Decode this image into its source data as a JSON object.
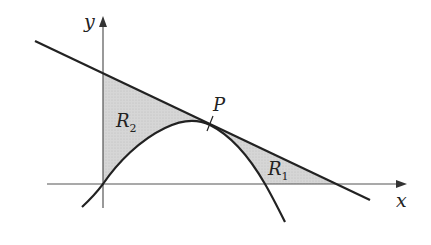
{
  "diagram": {
    "colors": {
      "stroke": "#222222",
      "axis": "#555555",
      "fill": "#d3d3d3",
      "background": "#ffffff"
    },
    "axes": {
      "x_label": "x",
      "y_label": "y"
    },
    "labels": {
      "point": "P",
      "region1": {
        "main": "R",
        "sub": "1"
      },
      "region2": {
        "main": "R",
        "sub": "2"
      }
    },
    "elements": [
      {
        "type": "line",
        "name": "tangent line",
        "description": "straight line with negative slope, tangent to curve at P"
      },
      {
        "type": "curve",
        "name": "parabola-like curve",
        "description": "passes through origin, touches line at P, then falls crossing x-axis"
      },
      {
        "type": "region",
        "name": "R1",
        "description": "shaded region between line, curve and x-axis, right of P"
      },
      {
        "type": "region",
        "name": "R2",
        "description": "shaded region between y-axis, line and curve, left of P"
      }
    ]
  }
}
